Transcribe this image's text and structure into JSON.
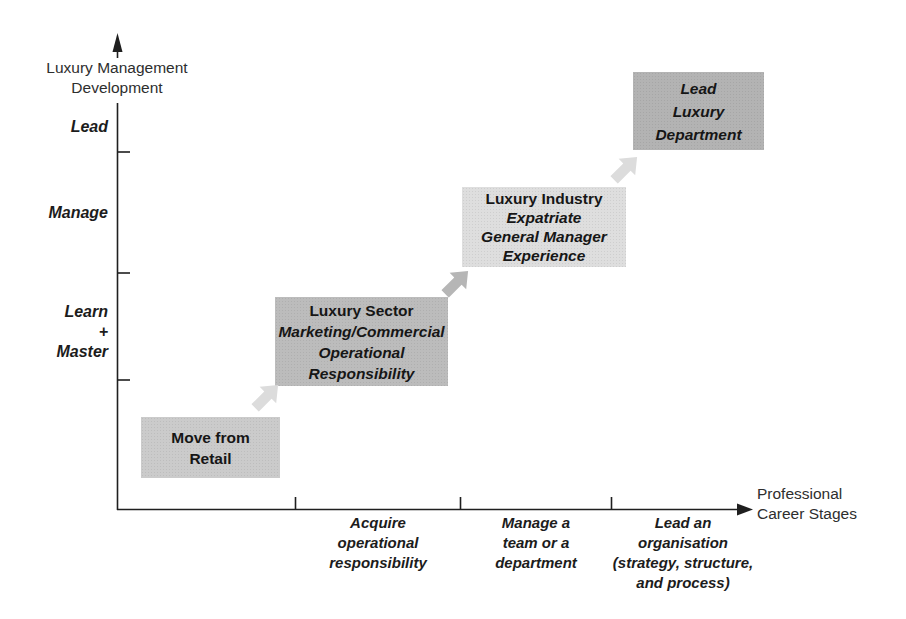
{
  "colors": {
    "background": "#ffffff",
    "axis": "#1f1f1f",
    "text": "#1c1c1c"
  },
  "y_axis": {
    "title": [
      "Luxury Management",
      "Development"
    ],
    "stages": [
      [
        "Lead"
      ],
      [
        "Manage"
      ],
      [
        "Learn",
        "+",
        "Master"
      ]
    ]
  },
  "x_axis": {
    "title": [
      "Professional",
      "Career Stages"
    ],
    "stages": [
      [
        "Acquire",
        "operational",
        "responsibility"
      ],
      [
        "Manage a",
        "team or a",
        "department"
      ],
      [
        "Lead an",
        "organisation",
        "(strategy, structure,",
        "and process)"
      ]
    ]
  },
  "boxes": [
    {
      "id": "move-from-retail",
      "title_lines": [
        "Move from",
        "Retail"
      ],
      "italic_lines": [],
      "color": "#cbcbcb"
    },
    {
      "id": "luxury-sector",
      "title_lines": [
        "Luxury Sector"
      ],
      "italic_lines": [
        "Marketing/Commercial",
        "Operational",
        "Responsibility"
      ],
      "color": "#bcbcbc"
    },
    {
      "id": "luxury-industry",
      "title_lines": [
        "Luxury Industry"
      ],
      "italic_lines": [
        "Expatriate",
        "General Manager",
        "Experience"
      ],
      "color": "#dedede"
    },
    {
      "id": "lead-luxury-department",
      "title_lines": [],
      "italic_lines": [
        "Lead",
        "Luxury",
        "Department"
      ],
      "color": "#b3b3b3"
    }
  ],
  "arrows": [
    {
      "id": "retail-to-sector",
      "color": "#dcdcdc"
    },
    {
      "id": "sector-to-industry",
      "color": "#b6b6b6"
    },
    {
      "id": "industry-to-department",
      "color": "#dcdcdc"
    }
  ]
}
